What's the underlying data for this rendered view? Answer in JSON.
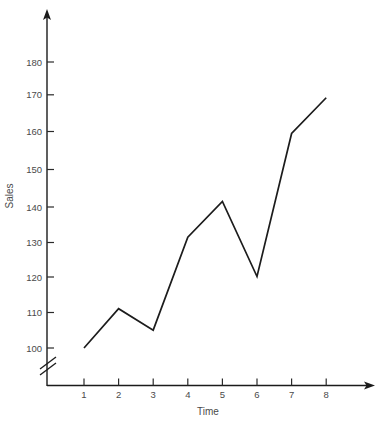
{
  "chart_data": {
    "type": "line",
    "title": "",
    "xlabel": "Time",
    "ylabel": "Sales",
    "x": [
      1,
      2,
      3,
      4,
      5,
      6,
      7,
      8
    ],
    "values": [
      100,
      111,
      105,
      131,
      141,
      120,
      160,
      170
    ],
    "series": [
      {
        "name": "Sales",
        "values": [
          100,
          111,
          105,
          131,
          141,
          120,
          160,
          170
        ]
      }
    ],
    "xticklabels": [
      "1",
      "2",
      "3",
      "4",
      "5",
      "6",
      "7",
      "8"
    ],
    "yticks": [
      100,
      110,
      120,
      130,
      140,
      150,
      160,
      170,
      180
    ],
    "yticklabels": [
      "100",
      "110",
      "120",
      "130",
      "140",
      "150",
      "160",
      "170",
      "180"
    ],
    "xlim": [
      0.4,
      9.2
    ],
    "ylim": [
      100,
      186
    ],
    "grid": false,
    "legend": false,
    "legend_position": "none",
    "axis_break": {
      "axis": "y",
      "present": true,
      "symbol": "double-slash",
      "below_value": 100
    },
    "line_color": "#1c1c1c",
    "axis_color": "#1b1b1b",
    "text_color": "#4a4a4a",
    "background_color": "#ffffff",
    "arrow_axes": true
  }
}
